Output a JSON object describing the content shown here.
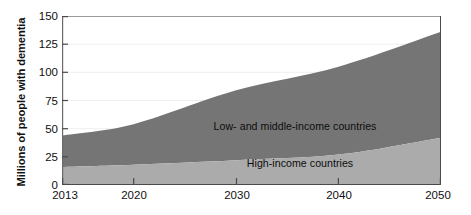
{
  "chart_data": {
    "type": "area",
    "stacked": true,
    "title": "",
    "subtitle": "",
    "xlabel": "",
    "ylabel": "Millions of people with dementia",
    "xlim": [
      2013,
      2050
    ],
    "ylim": [
      0,
      150
    ],
    "xticks": [
      "2013",
      "2020",
      "2030",
      "2040",
      "2050"
    ],
    "xtick_values": [
      2013,
      2020,
      2030,
      2040,
      2050
    ],
    "yticks": [
      "0",
      "25",
      "50",
      "75",
      "100",
      "125",
      "150"
    ],
    "ytick_values": [
      0,
      25,
      50,
      75,
      100,
      125,
      150
    ],
    "grid": "horizontal-faint",
    "legend_position": "in-plot-annotations",
    "x": [
      2013,
      2020,
      2030,
      2040,
      2050
    ],
    "series": [
      {
        "name": "High-income countries",
        "color": "#ababab",
        "values": [
          16,
          18,
          22,
          27,
          42
        ]
      },
      {
        "name": "Low- and middle-income countries",
        "color": "#757575",
        "values": [
          28,
          36,
          62,
          78,
          94
        ]
      }
    ],
    "totals": [
      44,
      54,
      84,
      105,
      136
    ],
    "annotations": [
      {
        "text": "Low- and middle-income countries",
        "x": 2036,
        "y": 66
      },
      {
        "text": "High-income countries",
        "x": 2036,
        "y": 30
      }
    ]
  },
  "axis": {
    "y_title": "Millions of people with dementia",
    "y_ticks": [
      "150",
      "125",
      "100",
      "75",
      "50",
      "25",
      "0"
    ],
    "x_ticks": [
      "2013",
      "2020",
      "2030",
      "2040",
      "2050"
    ]
  },
  "labels": {
    "lmic": "Low- and middle-income countries",
    "hic": "High-income countries"
  },
  "colors": {
    "low_middle_income": "#757575",
    "high_income": "#ababab",
    "axis": "#6b6b6b",
    "grid": "#efefef",
    "text": "#101010",
    "background": "#ffffff"
  }
}
